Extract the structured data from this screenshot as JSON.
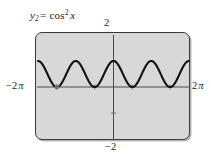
{
  "figure": {
    "equation": {
      "lhs_var": "y",
      "lhs_subscript": "2",
      "equals": "=",
      "function": "cos",
      "exponent": "2",
      "argument": "x",
      "plain": "y2 = cos^2 x"
    },
    "labels": {
      "y_max": "2",
      "y_min": "−2",
      "x_min_number": "−2",
      "x_min_symbol": "π",
      "x_max_number": "2",
      "x_max_symbol": "π"
    },
    "colors": {
      "screen_fill": "#d8d8d8",
      "screen_border": "#3a3a3a",
      "curve": "#111111",
      "axis": "#4a4a4a",
      "page_background": "#ffffff",
      "text": "#1c1c1c"
    }
  },
  "chart_data": {
    "type": "line",
    "xlabel": "",
    "ylabel": "",
    "xlim": [
      -6.283185307,
      6.283185307
    ],
    "ylim": [
      -2,
      2
    ],
    "xtick_labels": [
      "−2π",
      "2π"
    ],
    "ytick_labels": [
      "2",
      "−2"
    ],
    "grid": false,
    "legend": false,
    "axes_shown": [
      "x-axis at y=0",
      "y-axis at x=0"
    ],
    "tick_marks": {
      "x_ticks_at": [
        -4.71238898,
        -1.570796327,
        1.570796327,
        4.71238898
      ],
      "y_ticks_at": [
        -1,
        1
      ]
    },
    "series": [
      {
        "name": "y2 = cos^2 x",
        "formula": "cos(x)^2",
        "amplitude": 0.5,
        "vertical_shift": 0.5,
        "period": 3.141592653,
        "y_min": 0,
        "y_max": 1,
        "periods_visible": 4,
        "x": [
          -6.2832,
          -5.8905,
          -5.4978,
          -5.1051,
          -4.7124,
          -4.3197,
          -3.927,
          -3.5343,
          -3.1416,
          -2.7489,
          -2.3562,
          -1.9635,
          -1.5708,
          -1.1781,
          -0.7854,
          -0.3927,
          0.0,
          0.3927,
          0.7854,
          1.1781,
          1.5708,
          1.9635,
          2.3562,
          2.7489,
          3.1416,
          3.5343,
          3.927,
          4.3197,
          4.7124,
          5.1051,
          5.4978,
          5.8905,
          6.2832
        ],
        "y": [
          1.0,
          0.8536,
          0.5,
          0.1464,
          0.0,
          0.1464,
          0.5,
          0.8536,
          1.0,
          0.8536,
          0.5,
          0.1464,
          0.0,
          0.1464,
          0.5,
          0.8536,
          1.0,
          0.8536,
          0.5,
          0.1464,
          0.0,
          0.1464,
          0.5,
          0.8536,
          1.0,
          0.8536,
          0.5,
          0.1464,
          0.0,
          0.1464,
          0.5,
          0.8536,
          1.0
        ]
      }
    ]
  }
}
